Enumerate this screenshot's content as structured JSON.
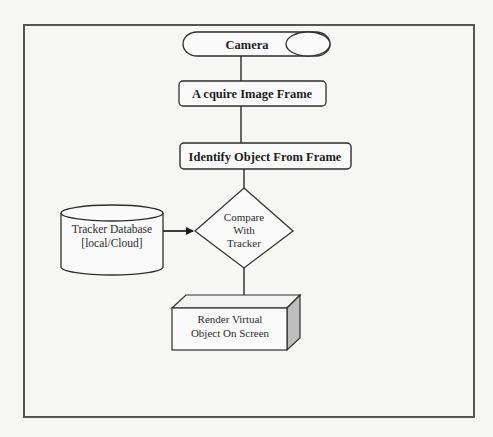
{
  "diagram": {
    "type": "flowchart",
    "nodes": {
      "camera": {
        "label": "Camera",
        "shape": "horizontal-cylinder"
      },
      "acquire": {
        "label": "A cquire Image Frame",
        "shape": "rounded-rectangle"
      },
      "identify": {
        "label": "Identify Object From Frame",
        "shape": "rounded-rectangle"
      },
      "compare": {
        "lines": [
          "Compare",
          "With",
          "Tracker"
        ],
        "shape": "diamond"
      },
      "database": {
        "lines": [
          "Tracker Database",
          "[local/Cloud]"
        ],
        "shape": "cylinder"
      },
      "render": {
        "lines": [
          "Render Virtual",
          "Object On Screen"
        ],
        "shape": "3d-box"
      }
    },
    "edges": [
      {
        "from": "camera",
        "to": "acquire",
        "arrow": false
      },
      {
        "from": "acquire",
        "to": "identify",
        "arrow": false
      },
      {
        "from": "identify",
        "to": "compare",
        "arrow": false
      },
      {
        "from": "database",
        "to": "compare",
        "arrow": true
      },
      {
        "from": "compare",
        "to": "render",
        "arrow": false
      }
    ],
    "colors": {
      "background": "#f6f6f4",
      "stroke": "#3a3a3a",
      "frame": "#555555",
      "shade": "#bdbdbd"
    }
  }
}
